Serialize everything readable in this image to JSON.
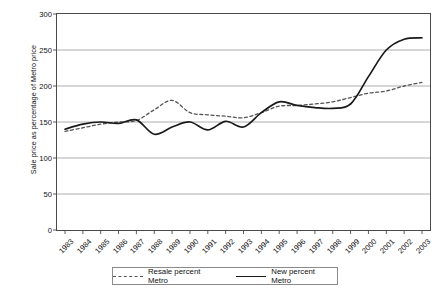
{
  "chart_data": {
    "type": "line",
    "title": "",
    "xlabel": "",
    "ylabel": "Sale price as percentage of Metro price",
    "ylim": [
      0,
      300
    ],
    "yticks": [
      0,
      50,
      100,
      150,
      200,
      250,
      300
    ],
    "grid": true,
    "legend_position": "bottom",
    "categories": [
      "1983",
      "1984",
      "1985",
      "1986",
      "1987",
      "1988",
      "1989",
      "1990",
      "1991",
      "1992",
      "1993",
      "1994",
      "1995",
      "1996",
      "1997",
      "1998",
      "1999",
      "2000",
      "2001",
      "2002",
      "2003"
    ],
    "series": [
      {
        "name": "Resale percent Metro",
        "style": "dashed",
        "color": "#555555",
        "values": [
          137,
          142,
          147,
          150,
          152,
          167,
          180,
          163,
          160,
          158,
          156,
          163,
          172,
          173,
          175,
          178,
          184,
          190,
          193,
          200,
          205
        ]
      },
      {
        "name": "New percent Metro",
        "style": "solid",
        "color": "#1a1a1a",
        "values": [
          140,
          147,
          150,
          148,
          153,
          133,
          143,
          150,
          139,
          151,
          143,
          163,
          178,
          173,
          170,
          169,
          175,
          213,
          250,
          265,
          267
        ]
      }
    ]
  },
  "axis": {
    "ytick_labels": [
      "0",
      "50",
      "100",
      "150",
      "200",
      "250",
      "300"
    ],
    "xtick_labels": [
      "1983",
      "1984",
      "1985",
      "1986",
      "1987",
      "1988",
      "1989",
      "1990",
      "1991",
      "1992",
      "1993",
      "1994",
      "1995",
      "1996",
      "1997",
      "1998",
      "1999",
      "2000",
      "2001",
      "2002",
      "2003"
    ]
  },
  "legend": {
    "entries": [
      {
        "label": "Resale percent Metro",
        "style": "dashed"
      },
      {
        "label": "New percent Metro",
        "style": "solid"
      }
    ]
  }
}
